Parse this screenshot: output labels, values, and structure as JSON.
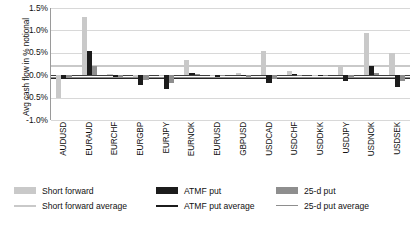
{
  "chart_data": {
    "type": "bar",
    "title": "",
    "xlabel": "",
    "ylabel": "Avg cash flow in % notional",
    "ylim": [
      -1.0,
      1.5
    ],
    "yticks": [
      "-1.0%",
      "-0.5%",
      "0.0%",
      "0.5%",
      "1.0%",
      "1.5%"
    ],
    "ytick_values": [
      -1.0,
      -0.5,
      0.0,
      0.5,
      1.0,
      1.5
    ],
    "grid": true,
    "legend_position": "bottom",
    "categories": [
      "AUDUSD",
      "EURAUD",
      "EURCHF",
      "EURGBP",
      "EURJPY",
      "EURNOK",
      "EURUSD",
      "GBPUSD",
      "USDCAD",
      "USDCHF",
      "USDDKK",
      "USDJPY",
      "USDNOK",
      "USDSEK"
    ],
    "series": [
      {
        "name": "Short forward",
        "color": "#c9c9c9",
        "values": [
          -0.52,
          1.31,
          0.02,
          -0.03,
          -0.02,
          0.35,
          -0.02,
          0.06,
          0.55,
          0.1,
          -0.02,
          0.22,
          0.95,
          0.5
        ]
      },
      {
        "name": "ATMF put",
        "color": "#1c1c1c",
        "values": [
          -0.09,
          0.55,
          -0.04,
          -0.21,
          -0.31,
          0.05,
          -0.03,
          -0.02,
          -0.18,
          0.02,
          -0.02,
          -0.13,
          0.2,
          -0.27
        ]
      },
      {
        "name": "25-d put",
        "color": "#8e8e8e",
        "values": [
          -0.05,
          0.21,
          -0.03,
          -0.1,
          -0.17,
          0.03,
          -0.02,
          -0.04,
          -0.09,
          0.01,
          -0.01,
          -0.07,
          0.04,
          -0.14
        ]
      }
    ],
    "averages": [
      {
        "name": "Short forward average",
        "color": "#c9c9c9",
        "value": 0.22
      },
      {
        "name": "ATMF put average",
        "color": "#262626",
        "value": -0.03
      },
      {
        "name": "25-d put average",
        "color": "#8e8e8e",
        "value": -0.035
      }
    ]
  },
  "legend": {
    "row1": [
      {
        "label": "Short forward",
        "swatch": "bar-swatch-short-forward"
      },
      {
        "label": "ATMF put",
        "swatch": "bar-swatch-atmf-put"
      },
      {
        "label": "25-d put",
        "swatch": "bar-swatch-25d-put"
      }
    ],
    "row2": [
      {
        "label": "Short forward average",
        "swatch": "line-swatch-short-forward-average"
      },
      {
        "label": "ATMF put average",
        "swatch": "line-swatch-atmf-put-average"
      },
      {
        "label": "25-d put average",
        "swatch": "line-swatch-25d-put-average"
      }
    ]
  },
  "caption": ""
}
